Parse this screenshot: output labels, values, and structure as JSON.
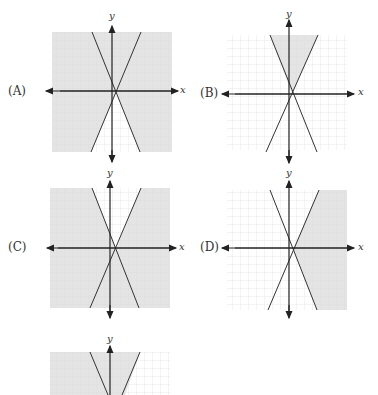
{
  "graphs": [
    {
      "label": "(A)",
      "x_axis": "x",
      "y_axis": "y",
      "ox": 52,
      "oy": 32,
      "shading": "all-except-bottom-wedge",
      "label_x": 8,
      "label_y": 84
    },
    {
      "label": "(B)",
      "x_axis": "x",
      "y_axis": "y",
      "ox": 227,
      "oy": 35,
      "shading": "top-wedge",
      "label_x": 200,
      "label_y": 85
    },
    {
      "label": "(C)",
      "x_axis": "x",
      "y_axis": "y",
      "ox": 50,
      "oy": 188,
      "shading": "all-except-top-wedge",
      "label_x": 8,
      "label_y": 240
    },
    {
      "label": "(D)",
      "x_axis": "x",
      "y_axis": "y",
      "ox": 227,
      "oy": 190,
      "shading": "right-wedge",
      "label_x": 200,
      "label_y": 240
    },
    {
      "label": "",
      "x_axis": "",
      "y_axis": "y",
      "ox": 50,
      "oy": 352,
      "shading": "left-of-right-line",
      "partial": true
    }
  ],
  "colors": {
    "shade": "#e4e4e4",
    "grid": "#d6d6d6",
    "line": "#333333"
  }
}
